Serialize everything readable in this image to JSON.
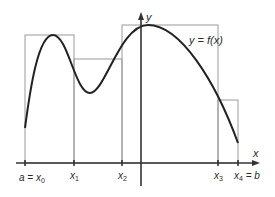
{
  "diagram": {
    "curve_label": "y = f(x)",
    "axes": {
      "x_label": "x",
      "y_label": "y"
    },
    "partition_labels": [
      {
        "main": "a = x",
        "sub": "0"
      },
      {
        "main": "x",
        "sub": "1"
      },
      {
        "main": "x",
        "sub": "2"
      },
      {
        "main": "x",
        "sub": "3"
      },
      {
        "main": "x",
        "sub": "4",
        "suffix": " = b"
      }
    ],
    "colors": {
      "curve": "#222222",
      "rectangles": "#9a9a9a",
      "axes": "#333333",
      "text": "#2a2a2a"
    },
    "rectangles": [
      {
        "x0": 25,
        "x1": 74,
        "top": 35
      },
      {
        "x0": 74,
        "x1": 122,
        "top": 59
      },
      {
        "x0": 122,
        "x1": 218,
        "top": 25
      },
      {
        "x0": 218,
        "x1": 238,
        "top": 100
      }
    ]
  }
}
